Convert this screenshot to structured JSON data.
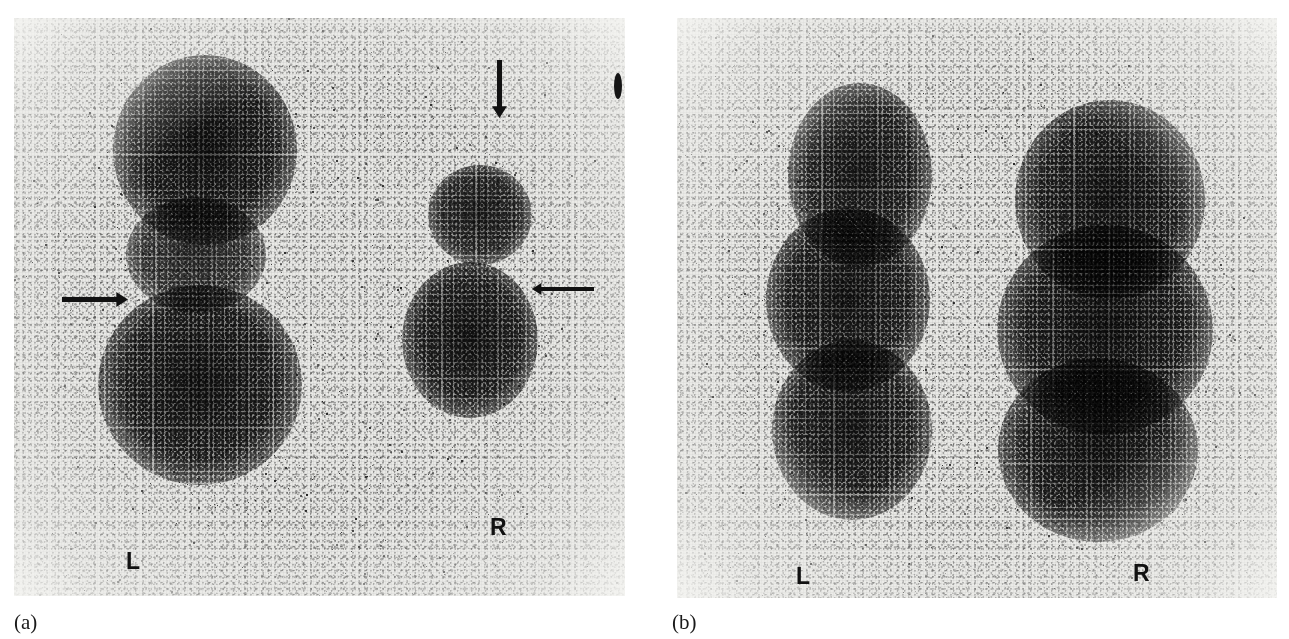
{
  "figure": {
    "kind": "renal-scintigram-pair",
    "background_color": "#ffffff",
    "film_background_color": "#e9e9e6",
    "ink_color": "#111111"
  },
  "panels": [
    {
      "id": "a",
      "caption": "(a)",
      "caption_position": {
        "x": 14,
        "y": 612
      },
      "frame": {
        "x": 14,
        "y": 18,
        "width": 611,
        "height": 578
      },
      "orientation_markers": [
        {
          "text": "L",
          "x": 126,
          "y": 550
        },
        {
          "text": "R",
          "x": 490,
          "y": 516
        }
      ],
      "arrows": [
        {
          "name": "arrow-down-right-upper-pole",
          "direction": "down",
          "x": 492,
          "y": 60,
          "length": 58,
          "thickness": 5
        },
        {
          "name": "arrow-right-left-kidney-notch",
          "direction": "right",
          "x": 62,
          "y": 292,
          "length": 66,
          "thickness": 5
        },
        {
          "name": "arrow-left-right-kidney-contour",
          "direction": "left",
          "x": 532,
          "y": 281,
          "length": 62,
          "thickness": 4
        }
      ],
      "uptake_regions": [
        {
          "name": "left-kidney-upper-pole",
          "cx": 205,
          "cy": 150,
          "rx": 92,
          "ry": 95,
          "intensity": 0.96
        },
        {
          "name": "left-kidney-mid",
          "cx": 196,
          "cy": 255,
          "rx": 70,
          "ry": 58,
          "intensity": 0.7
        },
        {
          "name": "left-kidney-lower-pole",
          "cx": 200,
          "cy": 385,
          "rx": 102,
          "ry": 100,
          "intensity": 0.94
        },
        {
          "name": "right-kidney-upper-pole",
          "cx": 480,
          "cy": 215,
          "rx": 52,
          "ry": 50,
          "intensity": 0.84
        },
        {
          "name": "right-kidney-lower-pole",
          "cx": 470,
          "cy": 340,
          "rx": 68,
          "ry": 78,
          "intensity": 0.92
        }
      ],
      "edge_artifact": {
        "x": 614,
        "y": 73,
        "width": 8,
        "height": 26
      }
    },
    {
      "id": "b",
      "caption": "(b)",
      "caption_position": {
        "x": 672,
        "y": 612
      },
      "frame": {
        "x": 677,
        "y": 18,
        "width": 600,
        "height": 580
      },
      "orientation_markers": [
        {
          "text": "L",
          "x": 796,
          "y": 565
        },
        {
          "text": "R",
          "x": 1133,
          "y": 562
        }
      ],
      "arrows": [],
      "uptake_regions": [
        {
          "name": "left-kidney-upper",
          "cx": 860,
          "cy": 175,
          "rx": 72,
          "ry": 92,
          "intensity": 0.88
        },
        {
          "name": "left-kidney-mid",
          "cx": 848,
          "cy": 300,
          "rx": 82,
          "ry": 92,
          "intensity": 0.92
        },
        {
          "name": "left-kidney-lower",
          "cx": 852,
          "cy": 430,
          "rx": 80,
          "ry": 90,
          "intensity": 0.9
        },
        {
          "name": "right-kidney-upper",
          "cx": 1110,
          "cy": 200,
          "rx": 95,
          "ry": 100,
          "intensity": 0.93
        },
        {
          "name": "right-kidney-mid",
          "cx": 1105,
          "cy": 330,
          "rx": 108,
          "ry": 105,
          "intensity": 0.97
        },
        {
          "name": "right-kidney-lower",
          "cx": 1098,
          "cy": 450,
          "rx": 100,
          "ry": 92,
          "intensity": 0.95
        }
      ],
      "edge_artifact": null
    }
  ]
}
